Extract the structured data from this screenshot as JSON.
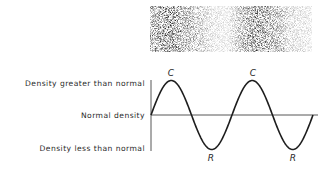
{
  "figure": {
    "density_strip": {
      "description": "Grainy gray strip showing alternating compressions (dark) and rarefactions (light)",
      "compression_count": 2
    },
    "axis_labels": {
      "high": "Density greater than normal",
      "normal": "Normal density",
      "low": "Density less than normal"
    },
    "wave": {
      "type": "sine",
      "cycles": 2,
      "peak_label": "C",
      "trough_label": "R",
      "peaks": [
        "C",
        "C"
      ],
      "troughs": [
        "R",
        "R"
      ]
    },
    "colors": {
      "ink": "#2a2a2a",
      "background": "#ffffff"
    }
  }
}
